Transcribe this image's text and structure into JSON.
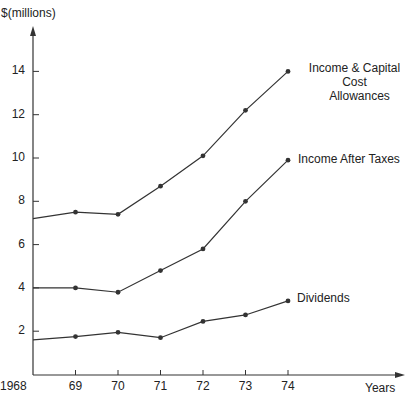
{
  "chart_data": {
    "type": "line",
    "title": "",
    "xlabel": "Years",
    "ylabel": "$(millions)",
    "x": [
      "1968",
      "69",
      "70",
      "71",
      "72",
      "73",
      "74"
    ],
    "y_ticks": [
      "2",
      "4",
      "6",
      "8",
      "10",
      "12",
      "14"
    ],
    "ylim": [
      0,
      15.5
    ],
    "grid": false,
    "legend": "inline labels at series ends",
    "series": [
      {
        "name": "Income & Capital Cost Allowances",
        "label_line1": "Income & Capital Cost",
        "label_line2": "Allowances",
        "values": [
          7.2,
          7.5,
          7.4,
          8.7,
          10.1,
          12.2,
          14.0
        ]
      },
      {
        "name": "Income After Taxes",
        "values": [
          4.0,
          4.0,
          3.8,
          4.8,
          5.8,
          8.0,
          9.9
        ]
      },
      {
        "name": "Dividends",
        "values": [
          1.6,
          1.75,
          1.95,
          1.7,
          2.45,
          2.75,
          3.4
        ]
      }
    ]
  },
  "colors": {
    "line": "#333333",
    "text": "#222222",
    "background": "#ffffff"
  }
}
